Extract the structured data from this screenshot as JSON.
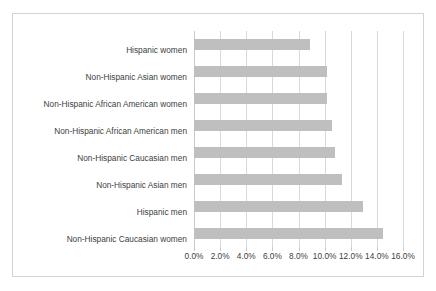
{
  "chart_data": {
    "type": "bar",
    "orientation": "horizontal",
    "title": "",
    "subtitle": "",
    "xlabel": "",
    "ylabel": "",
    "xlim": [
      0,
      16
    ],
    "xtick_labels": [
      "0.0%",
      "2.0%",
      "4.0%",
      "6.0%",
      "8.0%",
      "10.0%",
      "12.0%",
      "14.0%",
      "16.0%"
    ],
    "xtick_values": [
      0,
      2,
      4,
      6,
      8,
      10,
      12,
      14,
      16
    ],
    "grid": "vertical",
    "legend": "none",
    "categories": [
      "Hispanic women",
      "Non-Hispanic Asian women",
      "Non-Hispanic African American women",
      "Non-Hispanic African American men",
      "Non-Hispanic Caucasian men",
      "Non-Hispanic Asian men",
      "Hispanic men",
      "Non-Hispanic Caucasian women"
    ],
    "values": [
      8.9,
      10.2,
      10.2,
      10.6,
      10.8,
      11.3,
      12.9,
      14.5
    ],
    "value_labels": [
      "",
      "",
      "",
      "",
      "",
      "",
      "",
      ""
    ],
    "bar_color": "#bfbfbf",
    "gridline_color": "#d9d9d9",
    "text_color": "#404040",
    "border_color": "#d3d3d3",
    "background_color": "#ffffff"
  }
}
